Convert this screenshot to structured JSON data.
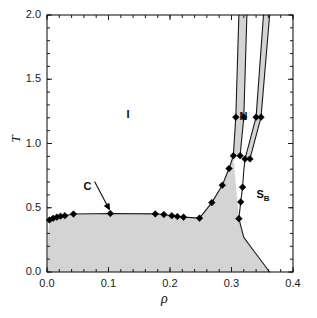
{
  "chart_data": {
    "type": "line",
    "title": "",
    "xlabel": "ρ",
    "ylabel": "T",
    "xlim": [
      0.0,
      0.4
    ],
    "ylim": [
      0.0,
      2.0
    ],
    "xticks": [
      0.0,
      0.1,
      0.2,
      0.3,
      0.4
    ],
    "xtick_labels": [
      "0.0",
      "0.1",
      "0.2",
      "0.3",
      "0.4"
    ],
    "yticks": [
      0.0,
      0.5,
      1.0,
      1.5,
      2.0
    ],
    "ytick_labels": [
      "0.0",
      "0.5",
      "1.0",
      "1.5",
      "2.0"
    ],
    "x_minor_step": 0.02,
    "y_minor_step": 0.1,
    "grid": false,
    "legend": "none",
    "marker": "filled-diamond",
    "shaded_region_color": "#d4d4d4",
    "line_color": "#1a1a1a",
    "background_color": "#ffffff",
    "annotations": [
      {
        "name": "isotropic-region",
        "text": "I",
        "x": 0.134,
        "y": 1.22
      },
      {
        "name": "nematic-region",
        "text": "N",
        "x": 0.318,
        "y": 1.21
      },
      {
        "name": "smectic-b-region",
        "text": "S",
        "subscript": "B",
        "x": 0.352,
        "y": 0.6
      },
      {
        "name": "critical-point",
        "text": "C",
        "x": 0.066,
        "y": 0.665,
        "arrow_to_x": 0.103,
        "arrow_to_y": 0.455
      }
    ],
    "series": [
      {
        "name": "isotropic-boundary-low-density",
        "points": [
          {
            "x": 0.004,
            "y": 0.405
          },
          {
            "x": 0.01,
            "y": 0.418
          },
          {
            "x": 0.016,
            "y": 0.427
          },
          {
            "x": 0.022,
            "y": 0.434
          },
          {
            "x": 0.029,
            "y": 0.438
          },
          {
            "x": 0.043,
            "y": 0.451
          },
          {
            "x": 0.103,
            "y": 0.455
          },
          {
            "x": 0.176,
            "y": 0.452
          },
          {
            "x": 0.19,
            "y": 0.447
          },
          {
            "x": 0.203,
            "y": 0.438
          },
          {
            "x": 0.212,
            "y": 0.432
          },
          {
            "x": 0.222,
            "y": 0.427
          },
          {
            "x": 0.248,
            "y": 0.419
          }
        ]
      },
      {
        "name": "isotropic-nematic-rising-branch",
        "points": [
          {
            "x": 0.248,
            "y": 0.419
          },
          {
            "x": 0.268,
            "y": 0.54
          },
          {
            "x": 0.285,
            "y": 0.675
          },
          {
            "x": 0.296,
            "y": 0.805
          },
          {
            "x": 0.303,
            "y": 0.905
          },
          {
            "x": 0.307,
            "y": 1.205
          },
          {
            "x": 0.312,
            "y": 2.0
          }
        ]
      },
      {
        "name": "nematic-left-band-right-edge",
        "points": [
          {
            "x": 0.314,
            "y": 0.905
          },
          {
            "x": 0.32,
            "y": 1.205
          },
          {
            "x": 0.325,
            "y": 2.0
          }
        ]
      },
      {
        "name": "nematic-right-band-left-edge",
        "points": [
          {
            "x": 0.322,
            "y": 0.88
          },
          {
            "x": 0.34,
            "y": 1.205
          },
          {
            "x": 0.352,
            "y": 2.0
          }
        ]
      },
      {
        "name": "nematic-right-band-right-edge",
        "points": [
          {
            "x": 0.33,
            "y": 0.88
          },
          {
            "x": 0.348,
            "y": 1.205
          },
          {
            "x": 0.362,
            "y": 2.0
          }
        ]
      },
      {
        "name": "smectic-b-boundary-descending",
        "points": [
          {
            "x": 0.322,
            "y": 0.88
          },
          {
            "x": 0.32,
            "y": 0.79
          },
          {
            "x": 0.318,
            "y": 0.66
          },
          {
            "x": 0.315,
            "y": 0.545
          },
          {
            "x": 0.312,
            "y": 0.415
          },
          {
            "x": 0.32,
            "y": 0.27
          },
          {
            "x": 0.34,
            "y": 0.14
          },
          {
            "x": 0.362,
            "y": 0.0
          }
        ]
      }
    ],
    "markers": [
      {
        "x": 0.004,
        "y": 0.405
      },
      {
        "x": 0.01,
        "y": 0.418
      },
      {
        "x": 0.016,
        "y": 0.427
      },
      {
        "x": 0.022,
        "y": 0.434
      },
      {
        "x": 0.029,
        "y": 0.438
      },
      {
        "x": 0.043,
        "y": 0.451
      },
      {
        "x": 0.103,
        "y": 0.455
      },
      {
        "x": 0.176,
        "y": 0.452
      },
      {
        "x": 0.19,
        "y": 0.447
      },
      {
        "x": 0.203,
        "y": 0.438
      },
      {
        "x": 0.212,
        "y": 0.432
      },
      {
        "x": 0.222,
        "y": 0.427
      },
      {
        "x": 0.248,
        "y": 0.419
      },
      {
        "x": 0.268,
        "y": 0.54
      },
      {
        "x": 0.285,
        "y": 0.675
      },
      {
        "x": 0.296,
        "y": 0.805
      },
      {
        "x": 0.303,
        "y": 0.905
      },
      {
        "x": 0.307,
        "y": 1.205
      },
      {
        "x": 0.314,
        "y": 0.905
      },
      {
        "x": 0.32,
        "y": 1.205
      },
      {
        "x": 0.322,
        "y": 0.88
      },
      {
        "x": 0.33,
        "y": 0.88
      },
      {
        "x": 0.34,
        "y": 1.205
      },
      {
        "x": 0.348,
        "y": 1.205
      },
      {
        "x": 0.318,
        "y": 0.66
      },
      {
        "x": 0.315,
        "y": 0.545
      },
      {
        "x": 0.312,
        "y": 0.415
      }
    ]
  }
}
